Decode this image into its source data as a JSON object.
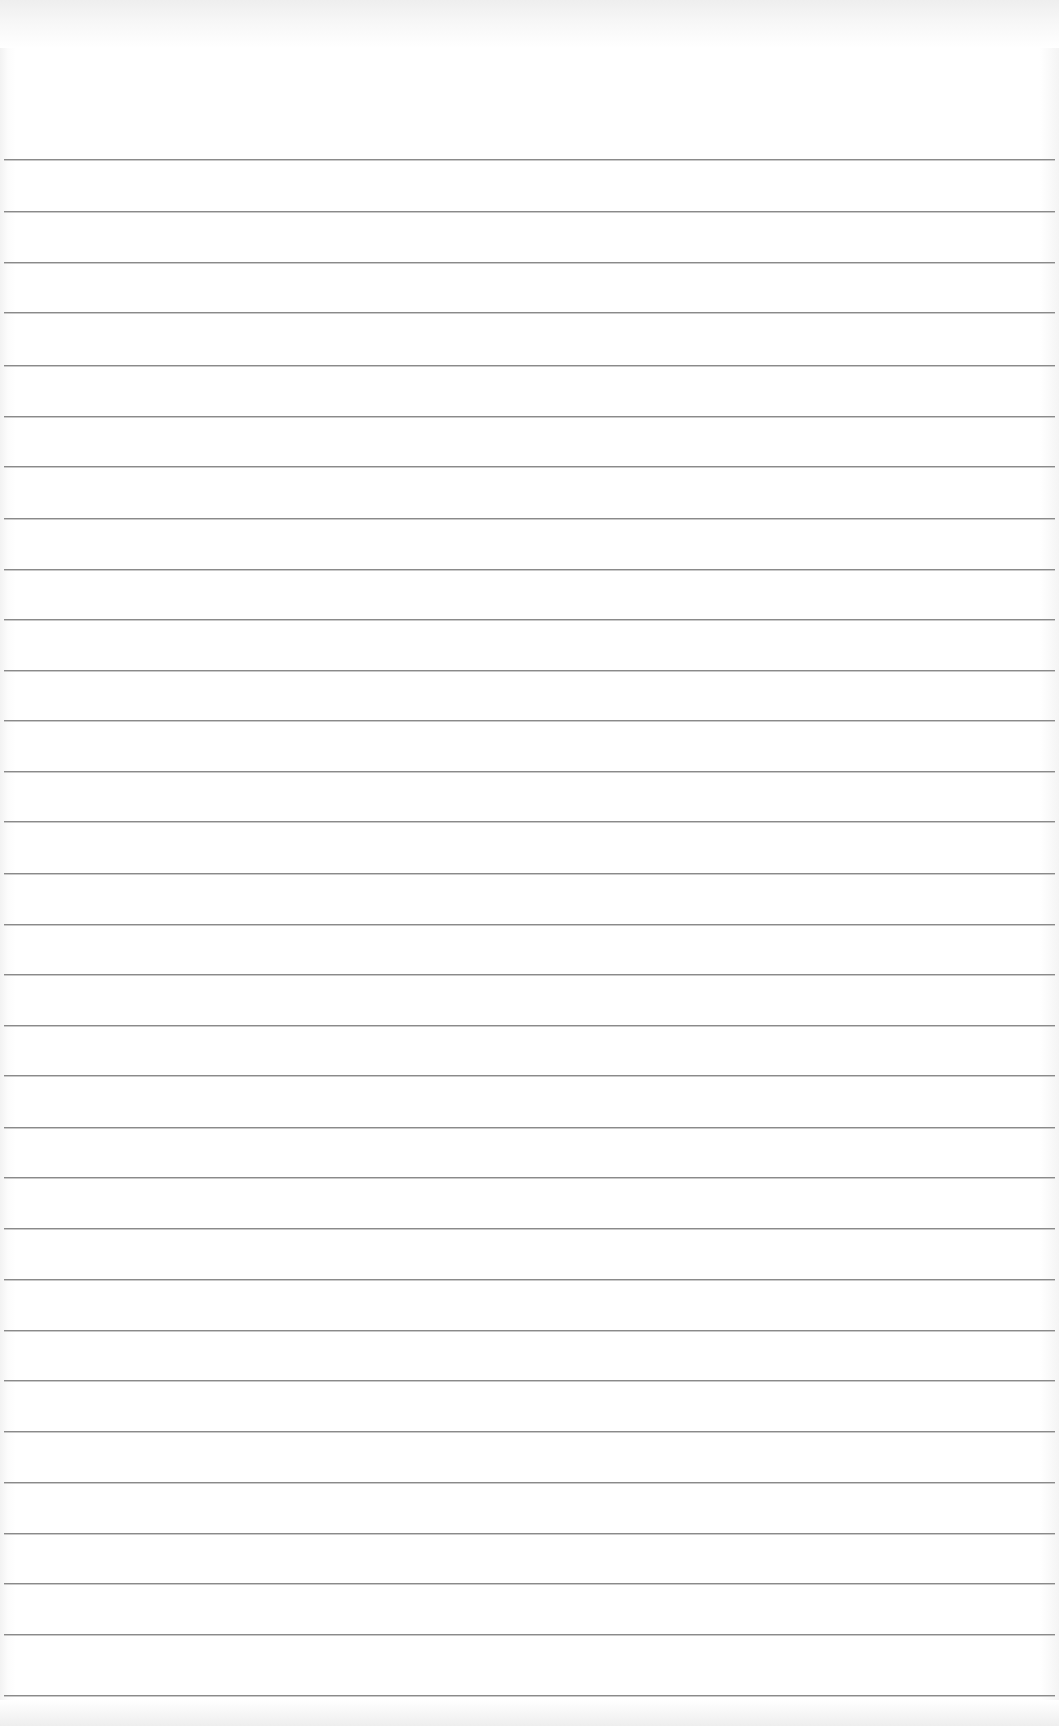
{
  "page": {
    "type": "lined-notepad-sheet",
    "background_color": "#ffffff",
    "rule_color": "#8a8a8a",
    "rule_count": 31,
    "rule_positions_y": [
      159,
      211,
      262,
      312,
      365,
      416,
      466,
      518,
      569,
      619,
      670,
      720,
      771,
      821,
      873,
      924,
      974,
      1025,
      1075,
      1127,
      1177,
      1228,
      1279,
      1330,
      1380,
      1431,
      1482,
      1533,
      1583,
      1634,
      1695
    ]
  }
}
